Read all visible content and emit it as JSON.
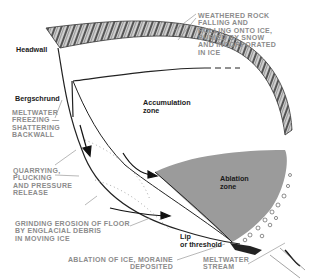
{
  "diagram": {
    "type": "glacial cirque cross-section",
    "colors": {
      "ablation_zone_fill": "#9b9b9b",
      "rock_band": "#7a7a7a",
      "callout_text": "#8c8c8c",
      "label_text": "#1a1a1a",
      "background": "#ffffff"
    },
    "labels": {
      "headwall": "Headwall",
      "bergschrund": "Bergschrund",
      "accumulation_zone": "Accumulation\nzone",
      "ablation_zone": "Ablation\nzone",
      "lip": "Lip\nor threshold"
    },
    "callouts": {
      "weathered_rock": "WEATHERED ROCK\nFALLING AND\nROLLING ONTO ICE,\nBURIED BY SNOW\nAND INCORPORATED\nIN ICE",
      "meltwater_freezing": "MELTWATER\nFREEZING —\nSHATTERING\nBACKWALL",
      "quarrying": "QUARRYING,\nPLUCKING\nAND PRESSURE\nRELEASE",
      "grinding": "GRINDING EROSION OF FLOOR\nBY ENGLACIAL DEBRIS\nIN MOVING ICE",
      "ablation_moraine": "ABLATION OF ICE, MORAINE\nDEPOSITED",
      "meltwater_stream": "MELTWATER\nSTREAM"
    }
  }
}
